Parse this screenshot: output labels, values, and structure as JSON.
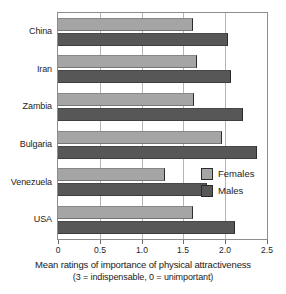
{
  "chart_data": {
    "type": "bar",
    "orientation": "horizontal",
    "title": "",
    "xlabel": "Mean ratings of importance of physical attractiveness",
    "xlabel_note": "(3 = indispensable, 0 = unimportant)",
    "ylabel": "",
    "categories": [
      "China",
      "Iran",
      "Zambia",
      "Bulgaria",
      "Venezuela",
      "USA"
    ],
    "series": [
      {
        "name": "Females",
        "color": "#a5a5a5",
        "values": [
          1.62,
          1.66,
          1.63,
          1.96,
          1.28,
          1.62
        ]
      },
      {
        "name": "Males",
        "color": "#575757",
        "values": [
          2.03,
          2.07,
          2.21,
          2.38,
          1.78,
          2.12
        ]
      }
    ],
    "xlim": [
      0,
      2.5
    ],
    "xticks": [
      0,
      0.5,
      1.0,
      1.5,
      2.0,
      2.5
    ],
    "xticklabels": [
      "0",
      "0.5",
      "1.0",
      "1.5",
      "2.0",
      "2.5"
    ],
    "grid": "vertical",
    "legend_position": "right-middle"
  },
  "legend": {
    "entries": [
      {
        "label": "Females"
      },
      {
        "label": "Males"
      }
    ]
  },
  "caption": {
    "line1": "Mean ratings of importance of physical attractiveness",
    "line2": "(3 = indispensable, 0 = unimportant)"
  }
}
